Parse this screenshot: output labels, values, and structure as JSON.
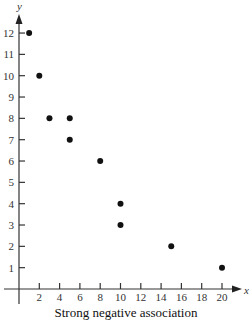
{
  "chart_data": {
    "type": "scatter",
    "title": "",
    "caption": "Strong negative association",
    "xlabel": "x",
    "ylabel": "y",
    "xlim": [
      0,
      21
    ],
    "ylim": [
      0,
      12.8
    ],
    "x_ticks": [
      2,
      4,
      6,
      8,
      10,
      12,
      14,
      16,
      18,
      20
    ],
    "y_ticks": [
      1,
      2,
      3,
      4,
      5,
      6,
      7,
      8,
      9,
      10,
      11,
      12
    ],
    "grid": false,
    "legend": null,
    "series": [
      {
        "name": "points",
        "x": [
          1,
          2,
          3,
          5,
          5,
          8,
          10,
          10,
          15,
          20
        ],
        "y": [
          12,
          10,
          8,
          8,
          7,
          6,
          4,
          3,
          2,
          1
        ]
      }
    ],
    "colors": {
      "points": "#111111",
      "axes": "#333333"
    }
  }
}
